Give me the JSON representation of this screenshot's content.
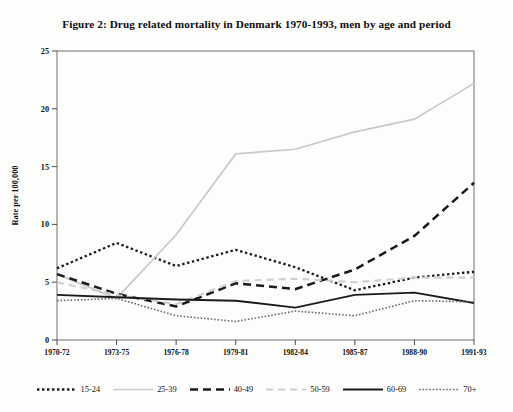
{
  "figure": {
    "title": "Figure 2: Drug related mortality in Denmark 1970-1993, men by age and period"
  },
  "chart_data": {
    "type": "line",
    "title": "Figure 2: Drug related mortality in Denmark 1970-1993, men by age and period",
    "xlabel": "Period",
    "ylabel": "Rate per 100,000",
    "categories": [
      "1970-72",
      "1973-75",
      "1976-78",
      "1979-81",
      "1982-84",
      "1985-87",
      "1988-90",
      "1991-93"
    ],
    "ylim": [
      0,
      25
    ],
    "yticks": [
      0,
      5,
      10,
      15,
      20,
      25
    ],
    "grid": false,
    "legend_position": "bottom",
    "series": [
      {
        "name": "15-24",
        "style": "dotted",
        "color": "#1a1a1a",
        "values": [
          6.2,
          8.4,
          6.4,
          7.8,
          6.3,
          4.3,
          5.4,
          5.9
        ]
      },
      {
        "name": "25-39",
        "style": "solid-light",
        "color": "#c9c9c9",
        "values": [
          5.7,
          3.6,
          9.1,
          16.1,
          16.5,
          18.0,
          19.1,
          22.2
        ]
      },
      {
        "name": "40-49",
        "style": "dashed",
        "color": "#1a1a1a",
        "values": [
          5.7,
          4.0,
          2.9,
          4.9,
          4.4,
          6.1,
          9.0,
          13.6
        ]
      },
      {
        "name": "50-59",
        "style": "dashed-light",
        "color": "#cfcfcf",
        "values": [
          5.0,
          3.9,
          3.1,
          5.1,
          5.3,
          5.0,
          5.4,
          5.4
        ]
      },
      {
        "name": "60-69",
        "style": "solid",
        "color": "#1a1a1a",
        "values": [
          3.9,
          3.7,
          3.5,
          3.4,
          2.8,
          3.9,
          4.1,
          3.2
        ]
      },
      {
        "name": "70+",
        "style": "fine-dotted",
        "color": "#6e6e6e",
        "values": [
          3.4,
          3.6,
          2.1,
          1.6,
          2.5,
          2.1,
          3.4,
          3.3
        ]
      }
    ]
  },
  "legend": {
    "items": [
      {
        "label": "15-24"
      },
      {
        "label": "25-39"
      },
      {
        "label": "40-49"
      },
      {
        "label": "50-59"
      },
      {
        "label": "60-69"
      },
      {
        "label": "70+"
      }
    ]
  }
}
